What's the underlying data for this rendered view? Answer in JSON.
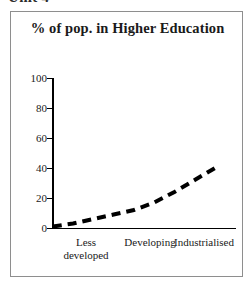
{
  "page": {
    "clipped_header_text": "Unit 4",
    "background_color": "#ffffff",
    "frame_border_color": "#8e8e8e"
  },
  "chart_data": {
    "type": "line",
    "title": "% of pop. in Higher Education",
    "xlabel": "",
    "ylabel": "",
    "categories": [
      "Less\ndeveloped",
      "Developing",
      "Industrialised"
    ],
    "category_labels": [
      {
        "id": "less-developed",
        "label": "Less\ndeveloped"
      },
      {
        "id": "developing",
        "label": "Developing"
      },
      {
        "id": "industrialised",
        "label": "Industrialised"
      }
    ],
    "x": [
      0,
      1,
      2
    ],
    "values": [
      1,
      12,
      40
    ],
    "series": [
      {
        "name": "% of pop. in Higher Education",
        "values": [
          1,
          12,
          40
        ],
        "line_style": "dashed",
        "line_color": "#000000",
        "line_width": 4
      }
    ],
    "curve_points": [
      {
        "x": 0.0,
        "y": 1
      },
      {
        "x": 0.25,
        "y": 3
      },
      {
        "x": 0.5,
        "y": 6
      },
      {
        "x": 0.75,
        "y": 9
      },
      {
        "x": 1.0,
        "y": 12
      },
      {
        "x": 1.25,
        "y": 17
      },
      {
        "x": 1.5,
        "y": 24
      },
      {
        "x": 1.75,
        "y": 32
      },
      {
        "x": 2.0,
        "y": 40
      }
    ],
    "ylim": [
      0,
      100
    ],
    "xlim": [
      0,
      2
    ],
    "yticks": [
      0,
      20,
      40,
      60,
      80,
      100
    ],
    "ytick_labels": [
      "0",
      "20",
      "40",
      "60",
      "80",
      "100"
    ],
    "grid": false,
    "legend": false,
    "legend_position": "none",
    "axis_color": "#000000",
    "text_color": "#1a1a1a"
  }
}
